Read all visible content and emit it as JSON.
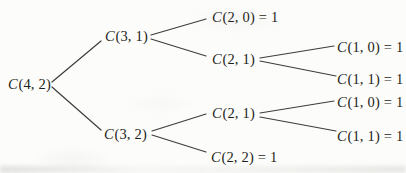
{
  "tree": {
    "root_value": "C(4, 2)",
    "nodes": [
      {
        "id": "c-4-2",
        "func": "C",
        "rest": "(4, 2)"
      },
      {
        "id": "c-3-1",
        "func": "C",
        "rest": "(3, 1)"
      },
      {
        "id": "c-2-0",
        "func": "C",
        "rest": "(2, 0) = 1"
      },
      {
        "id": "c-2-1-upper",
        "func": "C",
        "rest": "(2, 1)"
      },
      {
        "id": "c-1-0-upper",
        "func": "C",
        "rest": "(1, 0) = 1"
      },
      {
        "id": "c-1-1-upper",
        "func": "C",
        "rest": "(1, 1) = 1"
      },
      {
        "id": "c-3-2",
        "func": "C",
        "rest": "(3, 2)"
      },
      {
        "id": "c-2-1-lower",
        "func": "C",
        "rest": "(2, 1)"
      },
      {
        "id": "c-1-0-lower",
        "func": "C",
        "rest": "(1, 0) = 1"
      },
      {
        "id": "c-1-1-lower",
        "func": "C",
        "rest": "(1, 1) = 1"
      },
      {
        "id": "c-2-2",
        "func": "C",
        "rest": "(2, 2) = 1"
      }
    ],
    "edges": [
      [
        "c-4-2",
        "c-3-1"
      ],
      [
        "c-4-2",
        "c-3-2"
      ],
      [
        "c-3-1",
        "c-2-0"
      ],
      [
        "c-3-1",
        "c-2-1-upper"
      ],
      [
        "c-2-1-upper",
        "c-1-0-upper"
      ],
      [
        "c-2-1-upper",
        "c-1-1-upper"
      ],
      [
        "c-3-2",
        "c-2-1-lower"
      ],
      [
        "c-3-2",
        "c-2-2"
      ],
      [
        "c-2-1-lower",
        "c-1-0-lower"
      ],
      [
        "c-2-1-lower",
        "c-1-1-lower"
      ]
    ],
    "colors": {
      "text": "#1e1e20",
      "line": "#3d3d3d",
      "background": "#fcfcfa"
    }
  }
}
